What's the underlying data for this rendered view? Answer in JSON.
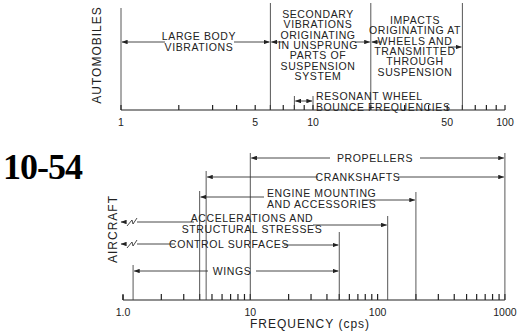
{
  "figure_number": "10-54",
  "chart_data": [
    {
      "type": "range_bar",
      "title": "Automobiles",
      "ylabel": "AUTOMOBILES",
      "xscale": "log",
      "xlim": [
        1,
        100
      ],
      "tick_labels": [
        {
          "value": 1,
          "label": "1"
        },
        {
          "value": 5,
          "label": "5"
        },
        {
          "value": 10,
          "label": "10"
        },
        {
          "value": 50,
          "label": "50"
        },
        {
          "value": 100,
          "label": "100"
        }
      ],
      "ranges": [
        {
          "label": [
            "LARGE BODY",
            "VIBRATIONS"
          ],
          "from": 1,
          "to": 6
        },
        {
          "label": [
            "SECONDARY",
            "VIBRATIONS",
            "ORIGINATING",
            "IN UNSPRUNG",
            "PARTS OF",
            "SUSPENSION",
            "SYSTEM"
          ],
          "from": 6,
          "to": 20
        },
        {
          "label": [
            "IMPACTS",
            "ORIGINATING AT",
            "WHEELS AND",
            "TRANSMITTED",
            "THROUGH",
            "SUSPENSION"
          ],
          "from": 20,
          "to": 60
        },
        {
          "label": [
            "RESONANT WHEEL",
            "BOUNCE FREQUENCIES"
          ],
          "from": 8,
          "to": 10
        }
      ]
    },
    {
      "type": "range_bar",
      "title": "Aircraft",
      "ylabel": "AIRCRAFT",
      "xlabel": "FREQUENCY (cps)",
      "xscale": "log",
      "xlim": [
        1,
        1000
      ],
      "tick_labels": [
        {
          "value": 1,
          "label": "1.0"
        },
        {
          "value": 10,
          "label": "10"
        },
        {
          "value": 100,
          "label": "100"
        },
        {
          "value": 1000,
          "label": "1000"
        }
      ],
      "ranges": [
        {
          "label": [
            "PROPELLERS"
          ],
          "from": 10,
          "to": 1000
        },
        {
          "label": [
            "CRANKSHAFTS"
          ],
          "from": 4.5,
          "to": 1000
        },
        {
          "label": [
            "ENGINE MOUNTING",
            "AND ACCESSORIES"
          ],
          "from": 4,
          "to": 200
        },
        {
          "label": [
            "ACCELERATIONS AND",
            "STRUCTURAL STRESSES"
          ],
          "from": "<1",
          "to": 120
        },
        {
          "label": [
            "CONTROL SURFACES"
          ],
          "from": "<1",
          "to": 50
        },
        {
          "label": [
            "WINGS"
          ],
          "from": 1.2,
          "to": 50
        }
      ]
    }
  ]
}
